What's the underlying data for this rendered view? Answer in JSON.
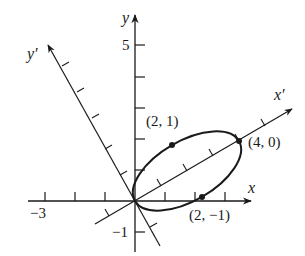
{
  "diagram": {
    "type": "rotated-axes-ellipse",
    "colors": {
      "ink": "#1a1a1a",
      "background": "#ffffff"
    },
    "axes": {
      "x": {
        "label": "x",
        "tick_label_negative": "−3"
      },
      "y": {
        "label": "y",
        "tick_label_top": "5",
        "tick_label_negative": "−1"
      },
      "x_prime": {
        "label": "x′",
        "rotation_deg": 30
      },
      "y_prime": {
        "label": "y′"
      }
    },
    "ellipse": {
      "center_xprime": 2,
      "center_yprime": 0,
      "semi_major": 2,
      "semi_minor": 1
    },
    "points": [
      {
        "label": "(2, 1)",
        "xprime": 2,
        "yprime": 1
      },
      {
        "label": "(4, 0)",
        "xprime": 4,
        "yprime": 0
      },
      {
        "label": "(2, −1)",
        "xprime": 2,
        "yprime": -1
      }
    ]
  }
}
